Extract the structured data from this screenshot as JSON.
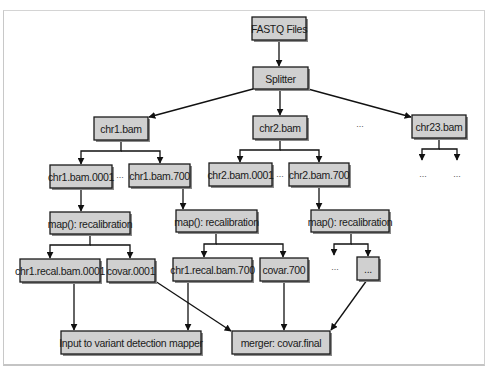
{
  "diagram": {
    "type": "flowchart",
    "nodes": [
      {
        "id": "fastq",
        "label": "FASTQ Files",
        "x": 252,
        "y": 17,
        "w": 54,
        "h": 23
      },
      {
        "id": "splitter",
        "label": "Splitter",
        "x": 253,
        "y": 67,
        "w": 55,
        "h": 22
      },
      {
        "id": "chr1",
        "label": "chr1.bam",
        "x": 94,
        "y": 117,
        "w": 54,
        "h": 23
      },
      {
        "id": "chr2",
        "label": "chr2.bam",
        "x": 253,
        "y": 116,
        "w": 54,
        "h": 23
      },
      {
        "id": "chr23",
        "label": "chr23.bam",
        "x": 412,
        "y": 115,
        "w": 54,
        "h": 23
      },
      {
        "id": "chr1_0001",
        "label": "chr1.bam.0001",
        "x": 50,
        "y": 165,
        "w": 62,
        "h": 23
      },
      {
        "id": "chr1_700",
        "label": "chr1.bam.700",
        "x": 129,
        "y": 164,
        "w": 61,
        "h": 23
      },
      {
        "id": "chr2_0001",
        "label": "chr2.bam.0001",
        "x": 209,
        "y": 163,
        "w": 63,
        "h": 23
      },
      {
        "id": "chr2_700",
        "label": "chr2.bam.700",
        "x": 289,
        "y": 163,
        "w": 60,
        "h": 23
      },
      {
        "id": "map1",
        "label": "map(): recalibration",
        "x": 50,
        "y": 212,
        "w": 80,
        "h": 22
      },
      {
        "id": "map2",
        "label": "map(): recalibration",
        "x": 176,
        "y": 210,
        "w": 81,
        "h": 22
      },
      {
        "id": "map3",
        "label": "map(): recalibration",
        "x": 311,
        "y": 210,
        "w": 78,
        "h": 22
      },
      {
        "id": "recal1_0001",
        "label": "chr1.recal.bam.0001",
        "x": 20,
        "y": 259,
        "w": 80,
        "h": 23
      },
      {
        "id": "covar_0001",
        "label": "covar.0001",
        "x": 107,
        "y": 259,
        "w": 48,
        "h": 23
      },
      {
        "id": "recal1_700",
        "label": "chr1.recal.bam.700",
        "x": 173,
        "y": 258,
        "w": 79,
        "h": 23
      },
      {
        "id": "covar_700",
        "label": "covar.700",
        "x": 260,
        "y": 258,
        "w": 48,
        "h": 23
      },
      {
        "id": "dots_box",
        "label": "...",
        "x": 357,
        "y": 257,
        "w": 22,
        "h": 23
      },
      {
        "id": "input_mapper",
        "label": "Input to variant detection mapper",
        "x": 61,
        "y": 331,
        "w": 140,
        "h": 23
      },
      {
        "id": "merger",
        "label": "merger: covar.final",
        "x": 232,
        "y": 331,
        "w": 98,
        "h": 23
      }
    ],
    "ellipses": [
      {
        "label": "...",
        "x": 360,
        "y": 127
      },
      {
        "label": "...",
        "x": 120,
        "y": 178
      },
      {
        "label": "...",
        "x": 280,
        "y": 177
      },
      {
        "label": "...",
        "x": 423,
        "y": 177
      },
      {
        "label": "...",
        "x": 457,
        "y": 177
      },
      {
        "label": "...",
        "x": 335,
        "y": 270
      }
    ],
    "edges": [
      {
        "from": "fastq",
        "to": "splitter",
        "path": "M279,40 L279,66",
        "arrow": true
      },
      {
        "from": "splitter",
        "to": "chr1",
        "path": "M253,89 L149,117",
        "arrow": true
      },
      {
        "from": "splitter",
        "to": "chr2",
        "path": "M280,89 L280,115",
        "arrow": true
      },
      {
        "from": "splitter",
        "to": "chr23",
        "path": "M308,89 L411,117",
        "arrow": true
      },
      {
        "from": "chr1",
        "to": "chr1_0001",
        "path": "M121,140 L121,151 L81,151 L81,164",
        "arrow": true
      },
      {
        "from": "chr1",
        "to": "chr1_700",
        "path": "M121,151 L160,151 L160,163",
        "arrow": true
      },
      {
        "from": "chr2",
        "to": "chr2_0001",
        "path": "M280,139 L280,150 L240,150 L240,162",
        "arrow": true
      },
      {
        "from": "chr2",
        "to": "chr2_700",
        "path": "M280,150 L319,150 L319,162",
        "arrow": true
      },
      {
        "from": "chr23",
        "to": "dots_a",
        "path": "M439,138 L439,149 L422,149 L422,160",
        "arrow": true
      },
      {
        "from": "chr23",
        "to": "dots_b",
        "path": "M439,149 L457,149 L457,160",
        "arrow": true
      },
      {
        "from": "chr1_0001",
        "to": "map1",
        "path": "M81,188 L81,211",
        "arrow": true
      },
      {
        "from": "chr1_700",
        "to": "map2",
        "path": "M183,187 L183,209",
        "arrow": true
      },
      {
        "from": "chr2_700",
        "to": "map3",
        "path": "M319,186 L319,209",
        "arrow": true
      },
      {
        "from": "map1",
        "to": "recal1_0001",
        "path": "M90,234 L90,245 L50,245 L50,258",
        "arrow": true
      },
      {
        "from": "map1",
        "to": "covar_0001",
        "path": "M90,245 L130,245 L130,258",
        "arrow": true
      },
      {
        "from": "map2",
        "to": "recal1_700",
        "path": "M216,232 L216,244 L204,244 L204,257",
        "arrow": true
      },
      {
        "from": "map2",
        "to": "covar_700",
        "path": "M216,244 L283,244 L283,257",
        "arrow": true
      },
      {
        "from": "map3",
        "to": "dots_c",
        "path": "M351,232 L351,244 L334,244 L334,255",
        "arrow": true
      },
      {
        "from": "map3",
        "to": "dots_box",
        "path": "M351,244 L368,244 L368,256",
        "arrow": true
      },
      {
        "from": "recal1_0001",
        "to": "input_mapper",
        "path": "M74,282 L74,330",
        "arrow": true
      },
      {
        "from": "recal1_700",
        "to": "input_mapper",
        "path": "M188,281 L188,330",
        "arrow": true
      },
      {
        "from": "covar_0001",
        "to": "merger",
        "path": "M155,281 L231,331",
        "arrow": true
      },
      {
        "from": "covar_700",
        "to": "merger",
        "path": "M284,281 L284,330",
        "arrow": true
      },
      {
        "from": "dots_box",
        "to": "merger",
        "path": "M367,280 L331,330",
        "arrow": true
      }
    ]
  }
}
